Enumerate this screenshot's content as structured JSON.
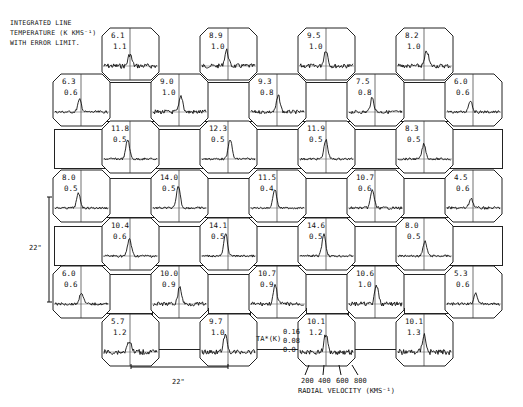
{
  "figure": {
    "caption_lines": [
      "INTEGRATED LINE",
      "TEMPERATURE (K KMS⁻¹)",
      "WITH ERROR LIMIT."
    ],
    "scale_vertical": "22\"",
    "scale_horizontal": "22\"",
    "y_axis_label": "TA*(K)",
    "y_ticks": [
      "0.16",
      "0.08",
      "0.0"
    ],
    "x_ticks": [
      "200",
      "400",
      "600",
      "800"
    ],
    "x_axis_label": "RADIAL VELOCITY (KMS⁻¹)"
  },
  "chart_data": {
    "type": "grid of spectra",
    "xlabel": "Radial velocity (km s^-1)",
    "ylabel": "TA* (K)",
    "x_ticks": [
      200,
      400,
      600,
      800
    ],
    "y_ticks": [
      0.0,
      0.08,
      0.16
    ],
    "grid_spacing_arcsec": 22,
    "panels": [
      {
        "row": 0,
        "col": 1,
        "value": "6.1",
        "error": "1.1"
      },
      {
        "row": 0,
        "col": 3,
        "value": "8.9",
        "error": "1.0"
      },
      {
        "row": 0,
        "col": 5,
        "value": "9.5",
        "error": "1.0"
      },
      {
        "row": 0,
        "col": 7,
        "value": "8.2",
        "error": "1.0"
      },
      {
        "row": 1,
        "col": 0,
        "value": "6.3",
        "error": "0.6"
      },
      {
        "row": 1,
        "col": 2,
        "value": "9.0",
        "error": "1.0"
      },
      {
        "row": 1,
        "col": 4,
        "value": "9.3",
        "error": "0.8"
      },
      {
        "row": 1,
        "col": 6,
        "value": "7.5",
        "error": "0.8"
      },
      {
        "row": 1,
        "col": 8,
        "value": "6.0",
        "error": "0.6"
      },
      {
        "row": 2,
        "col": 1,
        "value": "11.8",
        "error": "0.5"
      },
      {
        "row": 2,
        "col": 3,
        "value": "12.3",
        "error": "0.5"
      },
      {
        "row": 2,
        "col": 5,
        "value": "11.9",
        "error": "0.5"
      },
      {
        "row": 2,
        "col": 7,
        "value": "8.3",
        "error": "0.5"
      },
      {
        "row": 3,
        "col": 0,
        "value": "8.0",
        "error": "0.5"
      },
      {
        "row": 3,
        "col": 2,
        "value": "14.0",
        "error": "0.5"
      },
      {
        "row": 3,
        "col": 4,
        "value": "11.5",
        "error": "0.4"
      },
      {
        "row": 3,
        "col": 6,
        "value": "10.7",
        "error": "0.6"
      },
      {
        "row": 3,
        "col": 8,
        "value": "4.5",
        "error": "0.6"
      },
      {
        "row": 4,
        "col": 1,
        "value": "10.4",
        "error": "0.6"
      },
      {
        "row": 4,
        "col": 3,
        "value": "14.1",
        "error": "0.5"
      },
      {
        "row": 4,
        "col": 5,
        "value": "14.6",
        "error": "0.5"
      },
      {
        "row": 4,
        "col": 7,
        "value": "8.0",
        "error": "0.5"
      },
      {
        "row": 5,
        "col": 0,
        "value": "6.0",
        "error": "0.6"
      },
      {
        "row": 5,
        "col": 2,
        "value": "10.0",
        "error": "0.9"
      },
      {
        "row": 5,
        "col": 4,
        "value": "10.7",
        "error": "0.9"
      },
      {
        "row": 5,
        "col": 6,
        "value": "10.6",
        "error": "1.0"
      },
      {
        "row": 5,
        "col": 8,
        "value": "5.3",
        "error": "0.6"
      },
      {
        "row": 6,
        "col": 1,
        "value": "5.7",
        "error": "1.2"
      },
      {
        "row": 6,
        "col": 3,
        "value": "9.7",
        "error": "1.0"
      },
      {
        "row": 6,
        "col": 5,
        "value": "10.1",
        "error": "1.2"
      },
      {
        "row": 6,
        "col": 7,
        "value": "10.1",
        "error": "1.3"
      }
    ]
  }
}
